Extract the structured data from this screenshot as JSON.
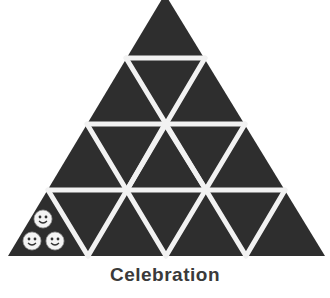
{
  "puzzle": {
    "title": "Celebration",
    "rows": 4,
    "colors": {
      "cell": "#2e2e2e",
      "grid": "#f2f2f2",
      "background": "#ffffff",
      "token": "#f4f4f4"
    },
    "tokens": [
      {
        "cell": "row4-left-corner",
        "icon": "smiley-face-icon",
        "count": 3
      }
    ]
  }
}
